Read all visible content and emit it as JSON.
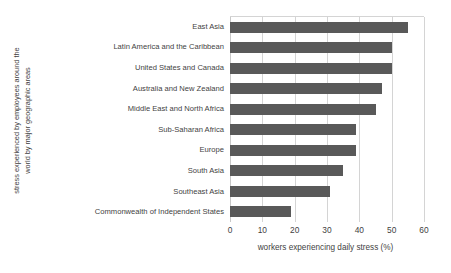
{
  "chart_data": {
    "type": "bar",
    "orientation": "horizontal",
    "title": "",
    "xlabel": "workers experiencing daily stress  (%)",
    "ylabel_lines": [
      "stress experienced by employees around the",
      "world by major geographic areas"
    ],
    "ylabel": "stress experienced by employees around the world by major geographic areas",
    "categories": [
      "East Asia",
      "Latin America and the Caribbean",
      "United States and Canada",
      "Australia and New Zealand",
      "Middle East and North Africa",
      "Sub-Saharan Africa",
      "Europe",
      "South Asia",
      "Southeast Asia",
      "Commonwealth of Independent States"
    ],
    "values": [
      55,
      50,
      50,
      47,
      45,
      39,
      39,
      35,
      31,
      19
    ],
    "xlim": [
      0,
      60
    ],
    "xticks": [
      0,
      10,
      20,
      30,
      40,
      50,
      60
    ],
    "xtick_labels": [
      "0",
      "10",
      "20",
      "30",
      "40",
      "50",
      "60"
    ],
    "grid": "vertical",
    "legend": "none",
    "bar_color": "#595959",
    "gridline_color": "#d4d4d4",
    "text_color": "#3f3f3f",
    "background_color": "#ffffff"
  }
}
